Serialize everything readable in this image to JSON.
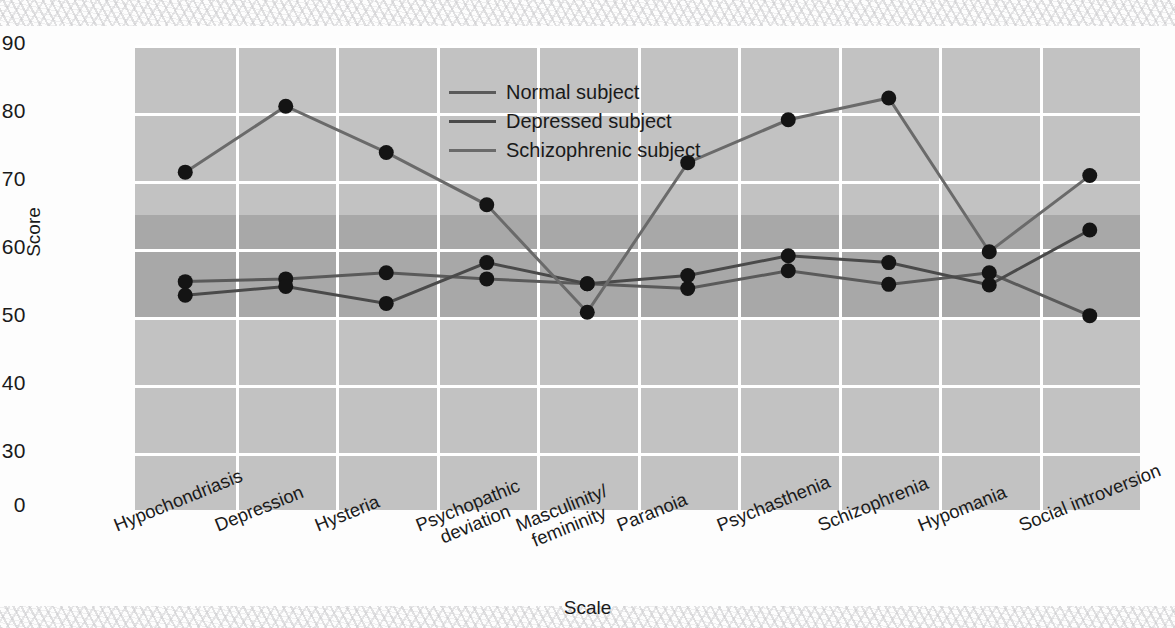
{
  "chart_data": {
    "type": "line",
    "title": "",
    "xlabel": "Scale",
    "ylabel": "Score",
    "categories": [
      "Hypochondriasis",
      "Depression",
      "Hysteria",
      "Psychopathic deviation",
      "Masculinity/ femininity",
      "Paranoia",
      "Psychasthenia",
      "Schizophrenia",
      "Hypomania",
      "Social introversion"
    ],
    "category_lines": [
      [
        "Hypochondriasis"
      ],
      [
        "Depression"
      ],
      [
        "Hysteria"
      ],
      [
        "Psychopathic",
        "deviation"
      ],
      [
        "Masculinity/",
        "femininity"
      ],
      [
        "Paranoia"
      ],
      [
        "Psychasthenia"
      ],
      [
        "Schizophrenia"
      ],
      [
        "Hypomania"
      ],
      [
        "Social introversion"
      ]
    ],
    "series": [
      {
        "name": "Normal subject",
        "color": "#5a5a5a",
        "values": [
          55.2,
          55.6,
          56.5,
          55.6,
          54.9,
          54.2,
          56.8,
          54.8,
          56.5,
          50.2
        ]
      },
      {
        "name": "Depressed subject",
        "color": "#4a4a4a",
        "values": [
          53.2,
          54.5,
          52.0,
          58.0,
          54.9,
          56.1,
          59.0,
          58.0,
          54.7,
          62.8
        ]
      },
      {
        "name": "Schizophrenic subject",
        "color": "#6a6a6a",
        "values": [
          71.3,
          81.0,
          74.2,
          66.5,
          50.7,
          72.7,
          79.0,
          82.2,
          59.6,
          70.8
        ]
      }
    ],
    "yticks": [
      90,
      80,
      70,
      60,
      50,
      40,
      30,
      0
    ],
    "ylim": [
      30,
      90
    ],
    "y_axis_broken": true,
    "grid": true,
    "legend_position": "inside-top-center",
    "normal_range_band": {
      "from": 50,
      "to": 65,
      "color": "#a8a8a8"
    },
    "plot_background": "#c2c2c2",
    "gridline_color": "#ffffff",
    "marker": "filled-circle",
    "marker_color": "#141414"
  }
}
